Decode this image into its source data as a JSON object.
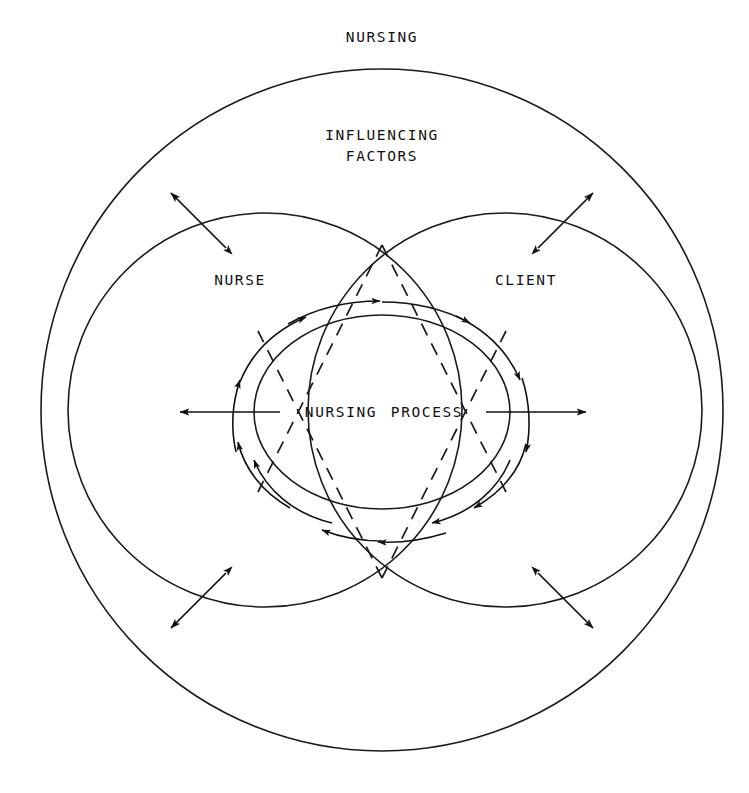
{
  "figure": {
    "kind": "conceptual-diagram",
    "title": "NURSING",
    "background_color": "#ffffff",
    "line_color": "#111111"
  },
  "labels": {
    "title": "NURSING",
    "influencing_line1": "INFLUENCING",
    "influencing_line2": "FACTORS",
    "nurse": "NURSE",
    "client": "CLIENT",
    "center_left": "NURSING",
    "center_right": "PROCESS"
  },
  "geometry": {
    "outer_circle": {
      "cx": 382,
      "cy": 410,
      "r": 341
    },
    "nurse_circle": {
      "cx": 265,
      "cy": 410,
      "r": 197
    },
    "client_circle": {
      "cx": 505,
      "cy": 410,
      "r": 197
    },
    "center_ellipse": {
      "cx": 382,
      "cy": 412,
      "rx": 128,
      "ry": 97
    },
    "dashed_ellipse": {
      "cx": 382,
      "cy": 412,
      "rx": 146,
      "ry": 152
    }
  },
  "arrows": {
    "radial_outward": [
      {
        "name": "left-outward",
        "from_x": 280,
        "from_y": 412,
        "to_x": 178,
        "to_y": 412,
        "direction": "left"
      },
      {
        "name": "right-outward",
        "from_x": 486,
        "from_y": 412,
        "to_x": 588,
        "to_y": 412,
        "direction": "right"
      }
    ],
    "double_headed_diagonals": [
      {
        "name": "top-left",
        "x1": 225,
        "y1": 247,
        "x2": 172,
        "y2": 194,
        "angle_deg": 225
      },
      {
        "name": "top-right",
        "x1": 539,
        "y1": 247,
        "x2": 592,
        "y2": 194,
        "angle_deg": 315
      },
      {
        "name": "bottom-left",
        "x1": 225,
        "y1": 574,
        "x2": 172,
        "y2": 627,
        "angle_deg": 135
      },
      {
        "name": "bottom-right",
        "x1": 539,
        "y1": 574,
        "x2": 592,
        "y2": 627,
        "angle_deg": 45
      }
    ],
    "orbit_flow": {
      "direction": "clockwise",
      "segment_count": 8,
      "description": "Curved arrow segments encircling the central nursing-process ellipse"
    }
  }
}
